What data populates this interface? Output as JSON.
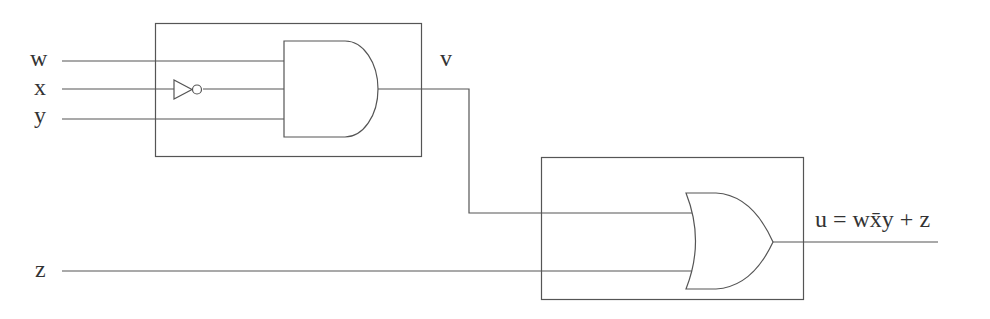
{
  "inputs": {
    "w": "w",
    "x": "x",
    "y": "y",
    "z": "z"
  },
  "intermediate": {
    "v": "v"
  },
  "output": {
    "label": "u = wx̄y + z"
  },
  "gates": [
    "AND",
    "NOT",
    "OR"
  ]
}
